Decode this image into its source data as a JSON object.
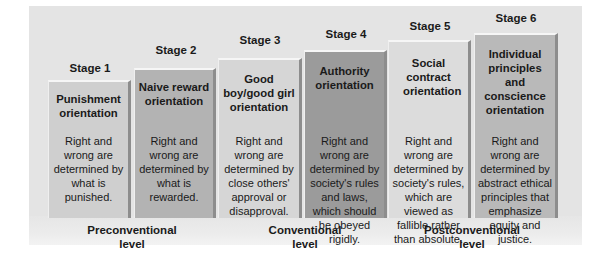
{
  "stages": [
    {
      "label": "Stage 1",
      "title": "Punishment orientation",
      "description": "Right and wrong are determined by what is punished.",
      "color": "#cfcfcf"
    },
    {
      "label": "Stage 2",
      "title": "Naive reward orientation",
      "description": "Right and wrong are determined by what is rewarded.",
      "color": "#b3b3b3"
    },
    {
      "label": "Stage 3",
      "title": "Good boy/good girl orientation",
      "description": "Right and wrong are determined by close others' approval or disapproval.",
      "color": "#d6d6d6"
    },
    {
      "label": "Stage 4",
      "title": "Authority orientation",
      "description": "Right and wrong are determined by society's rules and laws, which should be obeyed rigidly.",
      "color": "#9b9b9b"
    },
    {
      "label": "Stage 5",
      "title": "Social contract orientation",
      "description": "Right and wrong are determined by society's rules, which are viewed as fallible rather than absolute.",
      "color": "#dcdcdc"
    },
    {
      "label": "Stage 6",
      "title": "Individual principles and conscience orientation",
      "description": "Right and wrong are determined by abstract ethical principles that emphasize equity and justice.",
      "color": "#b9b9b9"
    }
  ],
  "levels": [
    {
      "line1": "Preconventional",
      "line2": "level"
    },
    {
      "line1": "Conventional",
      "line2": "level"
    },
    {
      "line1": "Postconventional",
      "line2": "level"
    }
  ]
}
